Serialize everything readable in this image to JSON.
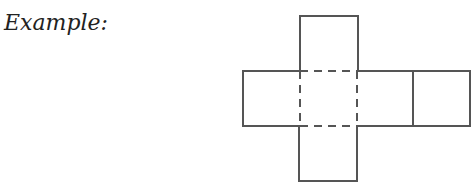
{
  "label": "Example:",
  "diagram": {
    "type": "cube-net",
    "faces": 6,
    "stroke_color": "#555555"
  }
}
